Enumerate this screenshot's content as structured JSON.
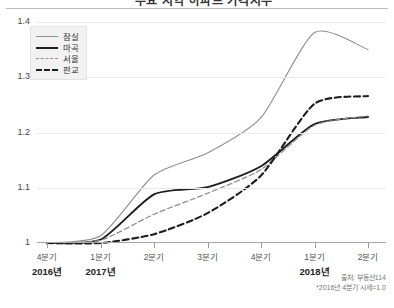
{
  "header": {
    "title": "주요 지역 아파트 가격지수",
    "divider": true
  },
  "legend": {
    "position": "top-left",
    "items": [
      {
        "label": "잠실",
        "style": "solid-thin",
        "color": "#8e8e8e"
      },
      {
        "label": "마곡",
        "style": "solid-bold",
        "color": "#1d1d1d"
      },
      {
        "label": "서울",
        "style": "dash-thin",
        "color": "#8e8e8e"
      },
      {
        "label": "판교",
        "style": "dash-bold",
        "color": "#1d1d1d"
      }
    ]
  },
  "axes": {
    "y_ticks": [
      "1.4",
      "1.3",
      "1.2",
      "1.1",
      "1"
    ],
    "y_values": [
      1.4,
      1.3,
      1.2,
      1.1,
      1.0
    ],
    "x_quarters": [
      "4분기",
      "1분기",
      "2분기",
      "3분기",
      "4분기",
      "1분기",
      "2분기"
    ],
    "x_years": [
      {
        "label": "2016년",
        "index": 0
      },
      {
        "label": "2017년",
        "index": 1
      },
      {
        "label": "2018년",
        "index": 5
      }
    ]
  },
  "footnotes": {
    "source": "출처: 부동산114",
    "note": "*2016년 4분기 시세=1.0"
  },
  "chart_data": {
    "type": "line",
    "title": "주요 지역 아파트 가격지수",
    "xlabel": "",
    "ylabel": "",
    "ylim": [
      1.0,
      1.4
    ],
    "grid": true,
    "legend_position": "top-left",
    "categories": [
      "4분기",
      "1분기",
      "2분기",
      "3분기",
      "4분기",
      "1분기",
      "2분기"
    ],
    "category_years": [
      "2016년",
      "2017년",
      "2017년",
      "2017년",
      "2017년",
      "2018년",
      "2018년"
    ],
    "series": [
      {
        "name": "잠실",
        "style": "solid-thin",
        "color": "#8e8e8e",
        "values": [
          1.0,
          1.013,
          1.123,
          1.163,
          1.227,
          1.381,
          1.35
        ]
      },
      {
        "name": "마곡",
        "style": "solid-bold",
        "color": "#1d1d1d",
        "values": [
          1.0,
          1.006,
          1.088,
          1.101,
          1.139,
          1.215,
          1.228
        ]
      },
      {
        "name": "서울",
        "style": "dash-thin",
        "color": "#8e8e8e",
        "values": [
          1.0,
          1.005,
          1.052,
          1.09,
          1.133,
          1.213,
          1.23
        ]
      },
      {
        "name": "판교",
        "style": "dash-bold",
        "color": "#1d1d1d",
        "values": [
          1.0,
          1.0,
          1.016,
          1.054,
          1.122,
          1.252,
          1.266
        ]
      }
    ],
    "baseline_note": "*2016년 4분기 시세=1.0",
    "source": "출처: 부동산114"
  }
}
